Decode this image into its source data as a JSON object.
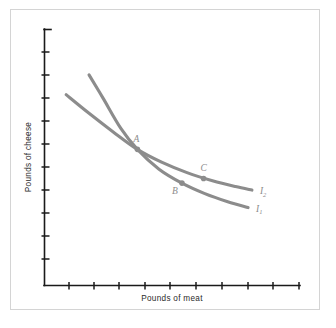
{
  "figure": {
    "background_color": "#ffffff",
    "frame_color": "#d4d4d4",
    "axis_color": "#1a1a1a",
    "curve_color": "#8c8c8c",
    "label_color": "#8c8c8c"
  },
  "chart_data": {
    "type": "line",
    "title": "",
    "subtitle": "",
    "xlabel": "Pounds of meat",
    "ylabel": "Pounds of cheese",
    "xlim": [
      0,
      10
    ],
    "ylim": [
      0,
      11
    ],
    "grid": false,
    "legend_position": "inline-right-end",
    "xtick_labels": [
      "",
      "",
      "",
      "",
      "",
      "",
      "",
      "",
      "",
      ""
    ],
    "ytick_labels": [
      "",
      "",
      "",
      "",
      "",
      "",
      "",
      "",
      "",
      "",
      ""
    ],
    "xtick_count": 10,
    "ytick_count": 11,
    "series": [
      {
        "name": "I1",
        "label": "I",
        "subscript": "1",
        "color": "#8c8c8c",
        "x": [
          1.75,
          2.3,
          3.0,
          3.65,
          4.5,
          5.4,
          6.3,
          7.2,
          8.0
        ],
        "y": [
          9.05,
          8.05,
          6.75,
          5.85,
          5.0,
          4.4,
          3.95,
          3.6,
          3.35
        ]
      },
      {
        "name": "I2",
        "label": "I",
        "subscript": "2",
        "color": "#8c8c8c",
        "x": [
          0.85,
          1.75,
          2.7,
          3.65,
          4.6,
          5.6,
          6.6,
          7.5,
          8.15
        ],
        "y": [
          8.2,
          7.4,
          6.6,
          5.85,
          5.3,
          4.85,
          4.5,
          4.25,
          4.1
        ]
      }
    ],
    "annotations": [
      {
        "name": "A",
        "label": "A",
        "x": 3.65,
        "y": 5.85,
        "series": "intersection",
        "has_dot": true,
        "label_position": "above-right"
      },
      {
        "name": "B",
        "label": "B",
        "x": 5.4,
        "y": 4.4,
        "series": "I1",
        "has_dot": true,
        "label_position": "below-left"
      },
      {
        "name": "C",
        "label": "C",
        "x": 6.25,
        "y": 4.6,
        "series": "I2",
        "has_dot": true,
        "label_position": "above"
      }
    ]
  }
}
